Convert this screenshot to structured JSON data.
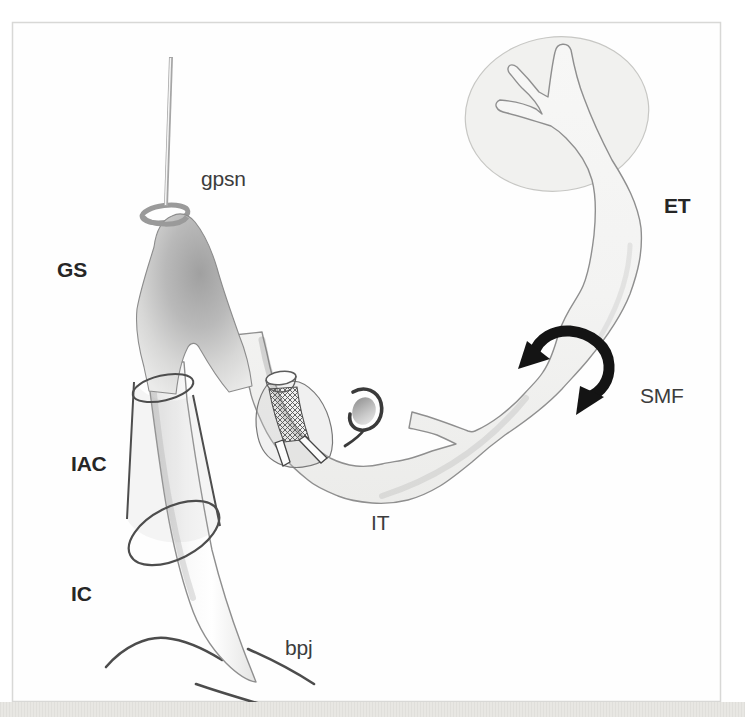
{
  "figure": {
    "type": "anatomical line diagram of nerve segments",
    "labels": {
      "gpsn": "gpsn",
      "gs": "GS",
      "et": "ET",
      "smf": "SMF",
      "iac": "IAC",
      "it": "IT",
      "ic": "IC",
      "bpj": "bpj"
    },
    "colors": {
      "frame_border": "#d8d8d6",
      "page_band": "#e8e7e3",
      "tube_fill": "#f4f4f3",
      "tube_stroke": "#8f8f8f",
      "ganglion_dark": "#a0a0a0",
      "cylinder_stroke": "#4d4d4d",
      "smf_ring": "#141414",
      "arc_stroke": "#4c4c4c",
      "ellipse_fill": "#f1f1ef",
      "ellipse_stroke": "#c7c7c4",
      "label_bold": "#262626",
      "label_regular": "#3c3c3c"
    }
  }
}
